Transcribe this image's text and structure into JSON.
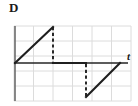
{
  "figure": {
    "panel_label": "D",
    "background_color": "#ffffff"
  },
  "axes": {
    "x_axis_label": "t",
    "y_axis_label": "",
    "x_axis_color": "#262626",
    "y_axis_color": "#6b6b6b",
    "grid_color": "#dcdcdc",
    "grid_visible": true,
    "grid_columns": 6,
    "grid_rows": 5
  },
  "chart_data": {
    "type": "line",
    "title": "D",
    "xlabel": "t",
    "ylabel": "",
    "grid": true,
    "legend": null,
    "xlim": [
      0,
      6
    ],
    "ylim": [
      -2,
      3
    ],
    "series": [
      {
        "name": "waveform",
        "color": "#1f1f1f",
        "line_width": 2,
        "style": "solid",
        "points": [
          [
            0,
            0
          ],
          [
            2,
            2
          ],
          [
            2,
            0
          ],
          [
            3.75,
            0
          ],
          [
            5.5,
            -1.75
          ],
          [
            7.25,
            0
          ]
        ]
      }
    ],
    "dashed_drops": [
      {
        "x": 2,
        "y_from": 2,
        "y_to": 0
      },
      {
        "x": 3.75,
        "y_from": 0,
        "y_to": -1.75
      }
    ]
  },
  "geometry": {
    "grid_left": 14,
    "grid_right": 131,
    "grid_top": 26,
    "grid_bottom": 101,
    "axis_y": 63,
    "axis_x": 15,
    "solid_path": "M 15 63 L 53 27 M 53 63 L 86 63 M 86 97 L 120 63",
    "dashed_path": "M 53 27 L 53 63 M 86 63 L 86 97"
  }
}
